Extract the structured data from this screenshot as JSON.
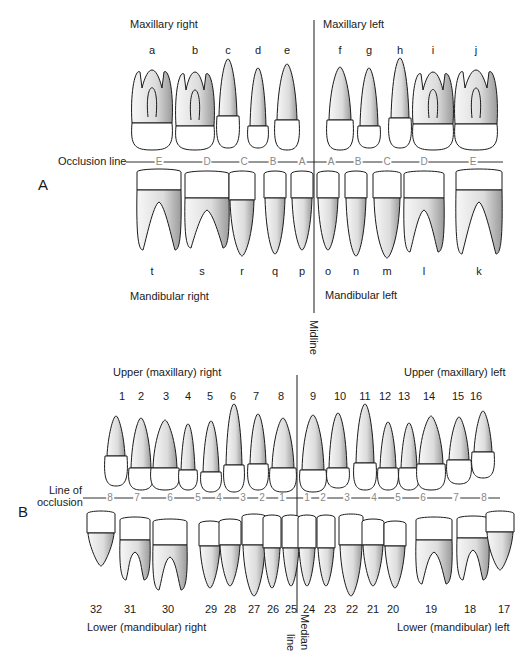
{
  "panel_a": {
    "label": "A",
    "quadrants": {
      "upper_right": "Maxillary right",
      "upper_left": "Maxillary left",
      "lower_right": "Mandibular right",
      "lower_left": "Mandibular left"
    },
    "occlusion_label": "Occlusion line",
    "midline_label": "Midline",
    "upper_teeth": [
      {
        "id": "a",
        "x": 152
      },
      {
        "id": "b",
        "x": 195
      },
      {
        "id": "c",
        "x": 228
      },
      {
        "id": "d",
        "x": 258
      },
      {
        "id": "e",
        "x": 287
      },
      {
        "id": "f",
        "x": 340
      },
      {
        "id": "g",
        "x": 369
      },
      {
        "id": "h",
        "x": 400
      },
      {
        "id": "i",
        "x": 433
      },
      {
        "id": "j",
        "x": 476
      }
    ],
    "lower_teeth": [
      {
        "id": "t",
        "x": 152
      },
      {
        "id": "s",
        "x": 202
      },
      {
        "id": "r",
        "x": 242
      },
      {
        "id": "q",
        "x": 275
      },
      {
        "id": "p",
        "x": 302
      },
      {
        "id": "o",
        "x": 328
      },
      {
        "id": "n",
        "x": 356
      },
      {
        "id": "m",
        "x": 387
      },
      {
        "id": "l",
        "x": 424
      },
      {
        "id": "k",
        "x": 479
      }
    ],
    "occlusion_marks": [
      {
        "t": "E",
        "x": 159
      },
      {
        "t": "D",
        "x": 207
      },
      {
        "t": "C",
        "x": 244
      },
      {
        "t": "B",
        "x": 273
      },
      {
        "t": "A",
        "x": 302
      },
      {
        "t": "A",
        "x": 331
      },
      {
        "t": "B",
        "x": 358
      },
      {
        "t": "C",
        "x": 387
      },
      {
        "t": "D",
        "x": 424
      },
      {
        "t": "E",
        "x": 473
      }
    ]
  },
  "panel_b": {
    "label": "B",
    "quadrants": {
      "upper_right": "Upper (maxillary) right",
      "upper_left": "Upper (maxillary) left",
      "lower_right": "Lower (mandibular) right",
      "lower_left": "Lower (mandibular) left"
    },
    "occlusion_label_line1": "Line of",
    "occlusion_label_line2": "occlusion",
    "median_label_1": "Median",
    "median_label_2": "line",
    "upper_teeth": [
      {
        "n": "1",
        "x": 122
      },
      {
        "n": "2",
        "x": 141
      },
      {
        "n": "3",
        "x": 166
      },
      {
        "n": "4",
        "x": 188
      },
      {
        "n": "5",
        "x": 210
      },
      {
        "n": "6",
        "x": 233
      },
      {
        "n": "7",
        "x": 256
      },
      {
        "n": "8",
        "x": 281
      },
      {
        "n": "9",
        "x": 313
      },
      {
        "n": "10",
        "x": 340
      },
      {
        "n": "11",
        "x": 365
      },
      {
        "n": "12",
        "x": 385
      },
      {
        "n": "13",
        "x": 404
      },
      {
        "n": "14",
        "x": 429
      },
      {
        "n": "15",
        "x": 458
      },
      {
        "n": "16",
        "x": 476
      }
    ],
    "lower_teeth": [
      {
        "n": "32",
        "x": 96
      },
      {
        "n": "31",
        "x": 130
      },
      {
        "n": "30",
        "x": 168
      },
      {
        "n": "29",
        "x": 211
      },
      {
        "n": "28",
        "x": 230
      },
      {
        "n": "27",
        "x": 254
      },
      {
        "n": "26",
        "x": 273
      },
      {
        "n": "25",
        "x": 291
      },
      {
        "n": "24",
        "x": 309
      },
      {
        "n": "23",
        "x": 330
      },
      {
        "n": "22",
        "x": 352
      },
      {
        "n": "21",
        "x": 373
      },
      {
        "n": "20",
        "x": 393
      },
      {
        "n": "19",
        "x": 431
      },
      {
        "n": "18",
        "x": 470
      },
      {
        "n": "17",
        "x": 504
      }
    ],
    "occlusion_marks": [
      {
        "t": "8",
        "x": 110
      },
      {
        "t": "7",
        "x": 137
      },
      {
        "t": "6",
        "x": 170
      },
      {
        "t": "5",
        "x": 198
      },
      {
        "t": "4",
        "x": 219
      },
      {
        "t": "3",
        "x": 243
      },
      {
        "t": "2",
        "x": 262
      },
      {
        "t": "1",
        "x": 282
      },
      {
        "t": "1",
        "x": 307
      },
      {
        "t": "2",
        "x": 323
      },
      {
        "t": "3",
        "x": 347
      },
      {
        "t": "4",
        "x": 374
      },
      {
        "t": "5",
        "x": 398
      },
      {
        "t": "6",
        "x": 423
      },
      {
        "t": "7",
        "x": 456
      },
      {
        "t": "8",
        "x": 484
      }
    ]
  },
  "colors": {
    "outline": "#1a1a1a",
    "root_shade": "#d9d9d9",
    "crown": "#ffffff",
    "mark": "#888888"
  }
}
